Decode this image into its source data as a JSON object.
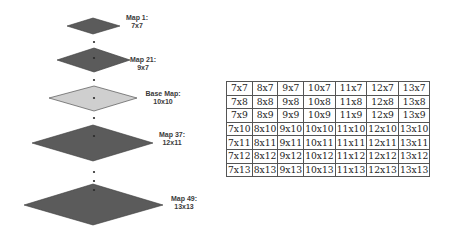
{
  "colors": {
    "dark_map": "#5b5b5b",
    "base_map": "#cfcfcf",
    "stroke": "#3a3a3a",
    "dot": "#2a2a2a",
    "table_border": "#555555"
  },
  "maps": [
    {
      "name": "Map 1:",
      "size": "7x7"
    },
    {
      "name": "Map 21:",
      "size": "9x7"
    },
    {
      "name": "Base Map:",
      "size": "10x10"
    },
    {
      "name": "Map 37:",
      "size": "12x11"
    },
    {
      "name": "Map 49:",
      "size": "13x13"
    }
  ],
  "table": {
    "rows": [
      [
        "7x7",
        "8x7",
        "9x7",
        "10x7",
        "11x7",
        "12x7",
        "13x7"
      ],
      [
        "7x8",
        "8x8",
        "9x8",
        "10x8",
        "11x8",
        "12x8",
        "13x8"
      ],
      [
        "7x9",
        "8x9",
        "9x9",
        "10x9",
        "11x9",
        "12x9",
        "13x9"
      ],
      [
        "7x10",
        "8x10",
        "9x10",
        "10x10",
        "11x10",
        "12x10",
        "13x10"
      ],
      [
        "7x11",
        "8x11",
        "9x11",
        "10x11",
        "11x11",
        "12x11",
        "13x11"
      ],
      [
        "7x12",
        "8x12",
        "9x12",
        "10x12",
        "11x12",
        "12x12",
        "13x12"
      ],
      [
        "7x13",
        "8x13",
        "9x13",
        "10x13",
        "11x13",
        "12x13",
        "13x13"
      ]
    ]
  }
}
